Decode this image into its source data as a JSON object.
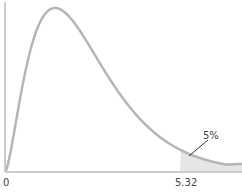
{
  "chart_data": {
    "type": "area",
    "title": "",
    "distribution": "F",
    "xlabel": "",
    "ylabel": "",
    "x_tick_labels": [
      "0",
      "5.32"
    ],
    "critical_value": 5.32,
    "shaded_tail": "right",
    "annotation": "5%",
    "tail_probability": 0.05,
    "xlim": [
      0,
      7.2
    ],
    "grid": false,
    "colors": {
      "curve": "#b5b5b5",
      "shade": "#e6e6e6",
      "axis": "#cccccc",
      "pointer": "#333333"
    }
  }
}
